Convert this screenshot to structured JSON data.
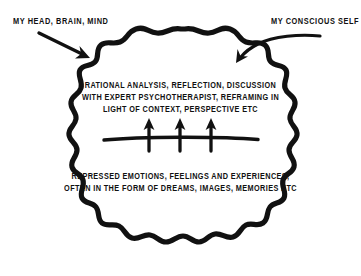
{
  "diagram": {
    "title_unlabeled": "",
    "background_color": "#ffffff",
    "ink_color": "#111111",
    "annotations": {
      "left_label": "MY HEAD, BRAIN, MIND",
      "right_label": "MY CONSCIOUS SELF",
      "left_arrow_icon": "straight-arrow-down-right",
      "right_arrow_icon": "curved-arrow-down-left"
    },
    "blob": {
      "shape_icon": "wavy-cloud-outline",
      "description_unlabeled": ""
    },
    "conscious_region": {
      "lines": [
        "RATIONAL ANALYSIS, REFLECTION, DISCUSSION",
        "WITH EXPERT PSYCHOTHERAPIST, REFRAMING IN",
        "LIGHT OF CONTEXT, PERSPECTIVE ETC"
      ]
    },
    "barrier": {
      "icon": "horizontal-divider-line",
      "arrow_icon": "upward-arrow",
      "arrow_count": 3
    },
    "unconscious_region": {
      "lines": [
        "REPRESSED EMOTIONS, FEELINGS AND EXPERIENCES,",
        "OFTEN IN THE FORM OF DREAMS, IMAGES, MEMORIES ETC"
      ]
    }
  }
}
